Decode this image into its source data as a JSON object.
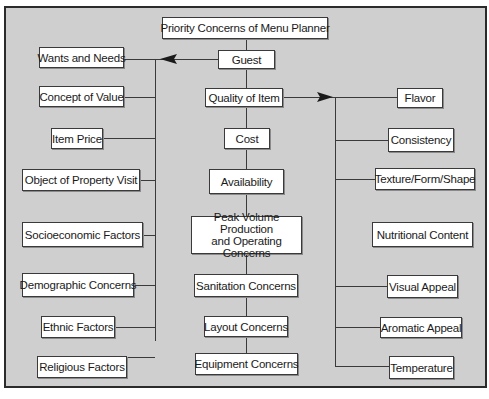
{
  "diagram": {
    "root": "Priority Concerns of Menu Planner",
    "center_column": [
      "Guest",
      "Quality of Item",
      "Cost",
      "Availability",
      "Peak Volume Production and Operating Concerns",
      "Sanitation Concerns",
      "Layout Concerns",
      "Equipment Concerns"
    ],
    "guest_factors": [
      "Wants and Needs",
      "Concept of Value",
      "Item Price",
      "Object of Property Visit",
      "Socioeconomic Factors",
      "Demographic Concerns",
      "Ethnic Factors",
      "Religious Factors"
    ],
    "quality_factors": [
      "Flavor",
      "Consistency",
      "Texture/Form/Shape",
      "Nutritional Content",
      "Visual Appeal",
      "Aromatic Appeal",
      "Temperature"
    ],
    "peak_line1": "Peak Volume Production",
    "peak_line2": "and Operating Concerns"
  },
  "colors": {
    "background": "#cfcfcf",
    "box": "#ffffff",
    "line": "#3a3a3a"
  }
}
